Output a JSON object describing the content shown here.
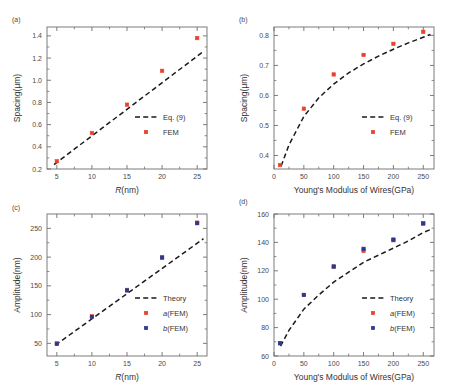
{
  "figure": {
    "panels": [
      {
        "label": "(a)",
        "xlabel_italic": "R",
        "xlabel_rest": "(nm)",
        "ylabel": "Spacing(μm)",
        "xticks": [
          "5",
          "10",
          "15",
          "20",
          "25"
        ],
        "yticks": [
          "0.2",
          "0.4",
          "0.6",
          "0.8",
          "1.0",
          "1.2",
          "1.4"
        ],
        "legend": [
          {
            "text": "Eq. (9)",
            "style": "dashed-line",
            "color": "#1a1a1a"
          },
          {
            "text": "FEM",
            "style": "square",
            "color": "#e8412c"
          }
        ]
      },
      {
        "label": "(b)",
        "xlabel_italic": "",
        "xlabel_rest": "Young's Modulus of Wires(GPa)",
        "ylabel": "Spacing(μm)",
        "xticks": [
          "0",
          "50",
          "100",
          "150",
          "200",
          "250"
        ],
        "yticks": [
          "0.4",
          "0.5",
          "0.6",
          "0.7",
          "0.8"
        ],
        "legend": [
          {
            "text": "Eq. (9)",
            "style": "dashed-line",
            "color": "#1a1a1a"
          },
          {
            "text": "FEM",
            "style": "square",
            "color": "#e8412c"
          }
        ]
      },
      {
        "label": "(c)",
        "xlabel_italic": "R",
        "xlabel_rest": "(nm)",
        "ylabel": "Amplitude(nm)",
        "xticks": [
          "5",
          "10",
          "15",
          "20",
          "25"
        ],
        "yticks": [
          "50",
          "100",
          "150",
          "200",
          "250"
        ],
        "legend": [
          {
            "text": "Theory",
            "style": "dashed-line",
            "color": "#1a1a1a"
          },
          {
            "text_italic": "a",
            "text": "(FEM)",
            "style": "square",
            "color": "#e8412c"
          },
          {
            "text_italic": "b",
            "text": "(FEM)",
            "style": "square",
            "color": "#2a3a8c"
          }
        ]
      },
      {
        "label": "(d)",
        "xlabel_italic": "",
        "xlabel_rest": "Young's Modulus of Wires(GPa)",
        "ylabel": "Amplitude(nm)",
        "xticks": [
          "0",
          "50",
          "100",
          "150",
          "200",
          "250"
        ],
        "yticks": [
          "60",
          "80",
          "100",
          "120",
          "140",
          "160"
        ],
        "legend": [
          {
            "text": "Theory",
            "style": "dashed-line",
            "color": "#1a1a1a"
          },
          {
            "text_italic": "a",
            "text": "(FEM)",
            "style": "square",
            "color": "#e8412c"
          },
          {
            "text_italic": "b",
            "text": "(FEM)",
            "style": "square",
            "color": "#2a3a8c"
          }
        ]
      }
    ]
  },
  "colors": {
    "fem_red": "#e8412c",
    "fem_blue": "#2a3a8c",
    "theory_black": "#1a1a1a",
    "axis": "#6e6e6e",
    "text": "#333333"
  },
  "chart_data": [
    {
      "type": "scatter",
      "panel": "a",
      "title": "",
      "xlabel": "R(nm)",
      "ylabel": "Spacing(μm)",
      "xlim": [
        3.6,
        26.4
      ],
      "ylim": [
        0.2,
        1.48
      ],
      "xticks": [
        5,
        10,
        15,
        20,
        25
      ],
      "yticks": [
        0.2,
        0.4,
        0.6,
        0.8,
        1.0,
        1.2,
        1.4
      ],
      "grid": false,
      "legend_position": "lower-right",
      "series": [
        {
          "name": "FEM",
          "marker": "square",
          "color": "#e8412c",
          "x": [
            5,
            10,
            15,
            20,
            25
          ],
          "values": [
            0.27,
            0.525,
            0.78,
            1.085,
            1.38
          ]
        },
        {
          "name": "Eq. (9)",
          "style": "dashed",
          "color": "#1a1a1a",
          "x": [
            4.6,
            25.9
          ],
          "values": [
            0.24,
            1.26
          ]
        }
      ]
    },
    {
      "type": "scatter",
      "panel": "b",
      "title": "",
      "xlabel": "Young's Modulus of Wires(GPa)",
      "ylabel": "Spacing(μm)",
      "xlim": [
        0,
        268
      ],
      "ylim": [
        0.355,
        0.828
      ],
      "xticks": [
        0,
        50,
        100,
        150,
        200,
        250
      ],
      "yticks": [
        0.4,
        0.5,
        0.6,
        0.7,
        0.8
      ],
      "grid": false,
      "legend_position": "lower-right",
      "series": [
        {
          "name": "FEM",
          "marker": "square",
          "color": "#e8412c",
          "x": [
            10,
            50,
            100,
            150,
            200,
            250
          ],
          "values": [
            0.368,
            0.556,
            0.67,
            0.735,
            0.772,
            0.812
          ]
        },
        {
          "name": "Eq. (9)",
          "style": "dashed",
          "color": "#1a1a1a",
          "x": [
            12,
            25,
            50,
            75,
            100,
            125,
            150,
            175,
            200,
            225,
            250,
            262
          ],
          "values": [
            0.365,
            0.435,
            0.53,
            0.592,
            0.638,
            0.675,
            0.705,
            0.731,
            0.754,
            0.775,
            0.794,
            0.803
          ]
        }
      ]
    },
    {
      "type": "scatter",
      "panel": "c",
      "title": "",
      "xlabel": "R(nm)",
      "ylabel": "Amplitude(nm)",
      "xlim": [
        3.6,
        26.4
      ],
      "ylim": [
        28,
        275
      ],
      "xticks": [
        5,
        10,
        15,
        20,
        25
      ],
      "yticks": [
        50,
        100,
        150,
        200,
        250
      ],
      "grid": false,
      "legend_position": "lower-right",
      "series": [
        {
          "name": "a(FEM)",
          "marker": "square",
          "color": "#e8412c",
          "x": [
            5,
            10,
            15,
            20,
            25
          ],
          "values": [
            50,
            97,
            143,
            200,
            260
          ]
        },
        {
          "name": "b(FEM)",
          "marker": "square",
          "color": "#2a3a8c",
          "x": [
            5,
            10,
            15,
            20,
            25
          ],
          "values": [
            49,
            96,
            142,
            199,
            259
          ]
        },
        {
          "name": "Theory",
          "style": "dashed",
          "color": "#1a1a1a",
          "x": [
            4.8,
            25.9
          ],
          "values": [
            47,
            232
          ]
        }
      ]
    },
    {
      "type": "scatter",
      "panel": "d",
      "title": "",
      "xlabel": "Young's Modulus of Wires(GPa)",
      "ylabel": "Amplitude(nm)",
      "xlim": [
        0,
        268
      ],
      "ylim": [
        60,
        160
      ],
      "xticks": [
        0,
        50,
        100,
        150,
        200,
        250
      ],
      "yticks": [
        60,
        80,
        100,
        120,
        140,
        160
      ],
      "grid": false,
      "legend_position": "lower-right",
      "series": [
        {
          "name": "a(FEM)",
          "marker": "square",
          "color": "#e8412c",
          "x": [
            10,
            50,
            100,
            150,
            200,
            250
          ],
          "values": [
            69,
            103,
            123,
            134,
            141.5,
            153
          ]
        },
        {
          "name": "b(FEM)",
          "marker": "square",
          "color": "#2a3a8c",
          "x": [
            10,
            50,
            100,
            150,
            200,
            250
          ],
          "values": [
            69,
            103,
            123,
            135.5,
            142,
            153.5
          ]
        },
        {
          "name": "Theory",
          "style": "dashed",
          "color": "#1a1a1a",
          "x": [
            11,
            25,
            50,
            75,
            100,
            125,
            150,
            175,
            200,
            225,
            250,
            262
          ],
          "values": [
            67,
            78,
            93,
            103,
            112,
            119,
            126,
            131,
            136,
            141,
            147,
            149
          ]
        }
      ]
    }
  ]
}
